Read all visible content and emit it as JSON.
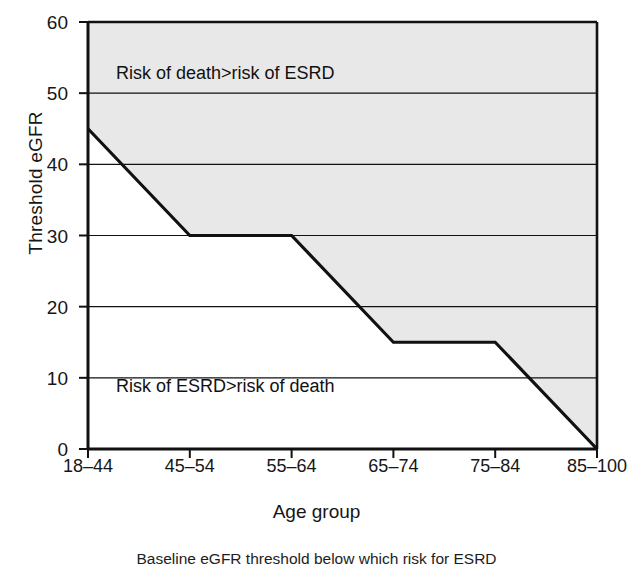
{
  "chart_data": {
    "type": "line",
    "title": "",
    "xlabel": "Age group",
    "ylabel": "Threshold eGFR",
    "categories": [
      "18–44",
      "45–54",
      "55–64",
      "65–74",
      "75–84",
      "85–100"
    ],
    "values": [
      45,
      30,
      30,
      15,
      15,
      0
    ],
    "series": [
      {
        "name": "Threshold eGFR",
        "values": [
          45,
          30,
          30,
          15,
          15,
          0
        ]
      }
    ],
    "ylim": [
      0,
      60
    ],
    "yticks": [
      0,
      10,
      20,
      30,
      40,
      50,
      60
    ],
    "ytick_labels": [
      "0",
      "10",
      "20",
      "30",
      "40",
      "50",
      "60"
    ],
    "grid": "horizontal",
    "legend": "none",
    "shaded_region": {
      "label": "Risk of death>risk of ESRD",
      "color": "#e8e8e8",
      "description": "area above the threshold line"
    },
    "unshaded_region": {
      "label": "Risk of ESRD>risk of death",
      "color": "#ffffff",
      "description": "area below the threshold line"
    },
    "annotations": [
      {
        "text": "Risk of death>risk of ESRD",
        "x_category": "18–44",
        "y": 52
      },
      {
        "text": "Risk of ESRD>risk of death",
        "x_category": "18–44",
        "y": 8
      }
    ],
    "line_color": "#111111",
    "line_width": 3
  },
  "caption": {
    "text": "Baseline eGFR threshold below which risk for ESRD"
  },
  "axes": {
    "x_title": "Age group",
    "y_title": "Threshold eGFR"
  }
}
